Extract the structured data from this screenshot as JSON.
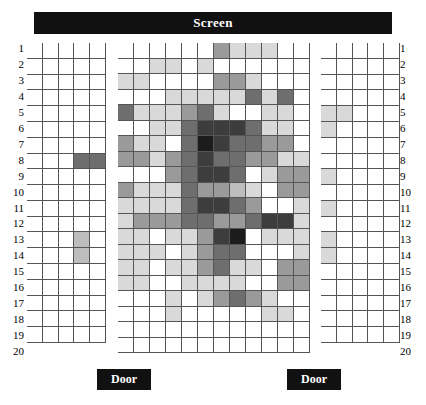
{
  "screen": {
    "label": "Screen"
  },
  "doors": [
    {
      "name": "door-left",
      "label": "Door"
    },
    {
      "name": "door-right",
      "label": "Door"
    }
  ],
  "row_labels": [
    "1",
    "2",
    "3",
    "4",
    "5",
    "6",
    "7",
    "8",
    "9",
    "10",
    "11",
    "12",
    "13",
    "14",
    "15",
    "16",
    "17",
    "18",
    "19",
    "20"
  ],
  "legend": {
    "level_colors": [
      "#ffffff",
      "#d9d9d9",
      "#bdbdbd",
      "#9a9a9a",
      "#6e6e6e",
      "#3d3d3d",
      "#1c1c1c"
    ],
    "description": "Seat occupancy / intensity, 0 = empty (white) through 6 = highest (near black)"
  },
  "chart_data": {
    "type": "heatmap",
    "title": "Screen",
    "xlabel": "",
    "ylabel": "",
    "grid": true,
    "legend_position": "none",
    "rows": 20,
    "row_labels": [
      "1",
      "2",
      "3",
      "4",
      "5",
      "6",
      "7",
      "8",
      "9",
      "10",
      "11",
      "12",
      "13",
      "14",
      "15",
      "16",
      "17",
      "18",
      "19",
      "20"
    ],
    "blocks": [
      {
        "name": "left-block",
        "columns": 5,
        "rows": 19,
        "values": [
          [
            0,
            0,
            0,
            0,
            0
          ],
          [
            0,
            0,
            0,
            0,
            0
          ],
          [
            0,
            0,
            0,
            0,
            0
          ],
          [
            0,
            0,
            0,
            0,
            0
          ],
          [
            0,
            0,
            0,
            0,
            0
          ],
          [
            0,
            0,
            0,
            0,
            0
          ],
          [
            0,
            0,
            0,
            0,
            0
          ],
          [
            0,
            0,
            0,
            4,
            4
          ],
          [
            0,
            0,
            0,
            0,
            0
          ],
          [
            0,
            0,
            0,
            0,
            0
          ],
          [
            0,
            0,
            0,
            0,
            0
          ],
          [
            0,
            0,
            0,
            0,
            0
          ],
          [
            0,
            0,
            0,
            2,
            0
          ],
          [
            0,
            0,
            0,
            2,
            0
          ],
          [
            0,
            0,
            0,
            0,
            0
          ],
          [
            0,
            0,
            0,
            0,
            0
          ],
          [
            0,
            0,
            0,
            0,
            0
          ],
          [
            0,
            0,
            0,
            0,
            0
          ],
          [
            0,
            0,
            0,
            0,
            0
          ]
        ]
      },
      {
        "name": "middle-block",
        "columns": 12,
        "rows": 20,
        "values": [
          [
            0,
            0,
            0,
            0,
            0,
            0,
            3,
            1,
            1,
            1,
            0,
            0
          ],
          [
            0,
            0,
            1,
            1,
            0,
            1,
            0,
            0,
            0,
            0,
            0,
            0
          ],
          [
            1,
            1,
            0,
            0,
            0,
            0,
            3,
            3,
            1,
            0,
            0,
            0
          ],
          [
            0,
            0,
            0,
            1,
            1,
            1,
            1,
            1,
            4,
            1,
            4,
            0
          ],
          [
            4,
            1,
            1,
            1,
            3,
            4,
            1,
            0,
            0,
            1,
            1,
            0
          ],
          [
            0,
            0,
            1,
            1,
            4,
            5,
            5,
            5,
            4,
            1,
            1,
            0
          ],
          [
            3,
            1,
            1,
            0,
            4,
            6,
            5,
            4,
            4,
            3,
            3,
            0
          ],
          [
            3,
            3,
            1,
            3,
            4,
            5,
            4,
            4,
            3,
            3,
            1,
            1
          ],
          [
            0,
            0,
            0,
            3,
            4,
            5,
            5,
            4,
            0,
            1,
            3,
            3
          ],
          [
            3,
            1,
            1,
            1,
            4,
            3,
            3,
            2,
            1,
            0,
            3,
            3
          ],
          [
            1,
            1,
            1,
            1,
            4,
            5,
            5,
            4,
            3,
            0,
            0,
            1
          ],
          [
            1,
            3,
            3,
            3,
            4,
            4,
            3,
            3,
            4,
            5,
            5,
            1
          ],
          [
            1,
            1,
            0,
            1,
            1,
            3,
            5,
            6,
            0,
            1,
            1,
            1
          ],
          [
            1,
            1,
            1,
            0,
            1,
            3,
            4,
            4,
            0,
            0,
            0,
            1
          ],
          [
            1,
            1,
            0,
            1,
            1,
            3,
            4,
            1,
            1,
            0,
            3,
            3
          ],
          [
            1,
            1,
            0,
            0,
            1,
            1,
            1,
            1,
            0,
            0,
            3,
            3
          ],
          [
            0,
            0,
            0,
            1,
            0,
            1,
            3,
            4,
            3,
            1,
            0,
            0
          ],
          [
            0,
            0,
            0,
            1,
            0,
            0,
            0,
            0,
            0,
            1,
            1,
            0
          ],
          [
            0,
            0,
            0,
            0,
            0,
            0,
            0,
            0,
            0,
            0,
            0,
            0
          ],
          [
            0,
            0,
            0,
            0,
            0,
            0,
            0,
            0,
            0,
            0,
            0,
            0
          ]
        ]
      },
      {
        "name": "right-block",
        "columns": 5,
        "rows": 19,
        "values": [
          [
            0,
            0,
            0,
            0,
            0
          ],
          [
            0,
            0,
            0,
            0,
            0
          ],
          [
            0,
            0,
            0,
            0,
            0
          ],
          [
            0,
            0,
            0,
            0,
            0
          ],
          [
            1,
            1,
            0,
            0,
            0
          ],
          [
            1,
            0,
            0,
            0,
            0
          ],
          [
            0,
            0,
            0,
            0,
            0
          ],
          [
            0,
            0,
            0,
            0,
            0
          ],
          [
            1,
            0,
            0,
            0,
            0
          ],
          [
            0,
            0,
            0,
            0,
            0
          ],
          [
            1,
            0,
            0,
            0,
            0
          ],
          [
            0,
            0,
            0,
            0,
            0
          ],
          [
            1,
            0,
            0,
            0,
            0
          ],
          [
            1,
            0,
            0,
            0,
            0
          ],
          [
            0,
            0,
            0,
            0,
            0
          ],
          [
            0,
            0,
            0,
            0,
            0
          ],
          [
            0,
            0,
            0,
            0,
            0
          ],
          [
            0,
            0,
            0,
            0,
            0
          ],
          [
            0,
            0,
            0,
            0,
            0
          ]
        ]
      }
    ]
  }
}
